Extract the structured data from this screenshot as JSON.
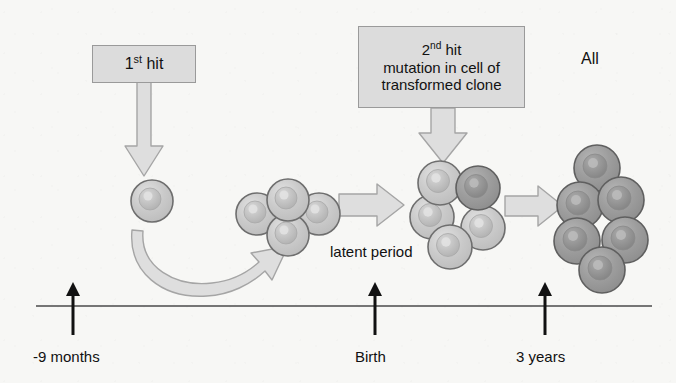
{
  "figure": {
    "background_color": "#f7f7f5",
    "boxes": [
      {
        "id": "first-hit",
        "lines": [
          "1st hit"
        ],
        "sup": "st",
        "x": 92,
        "y": 45,
        "w": 104,
        "h": 38,
        "font_size": 16,
        "fill": "#dcdcdc",
        "stroke": "#9a9a9a"
      },
      {
        "id": "second-hit",
        "lines": [
          "2nd hit",
          "mutation in cell of",
          "transformed clone"
        ],
        "sup": "nd",
        "x": 358,
        "y": 26,
        "w": 167,
        "h": 82,
        "font_size": 15,
        "fill": "#dcdcdc",
        "stroke": "#9a9a9a"
      }
    ],
    "labels": [
      {
        "id": "all-label",
        "text": "All",
        "x": 581,
        "y": 50,
        "font_size": 16
      },
      {
        "id": "latent-period-label",
        "text": "latent period",
        "x": 330,
        "y": 243,
        "font_size": 15
      }
    ],
    "timeline": {
      "y": 306,
      "x_start": 36,
      "x_end": 652,
      "color": "#4a4a4a",
      "ticks": [
        {
          "id": "tick-minus-9-months",
          "label": "-9 months",
          "x": 73,
          "label_x": 33,
          "label_y": 348
        },
        {
          "id": "tick-birth",
          "label": "Birth",
          "x": 375,
          "label_x": 355,
          "label_y": 348
        },
        {
          "id": "tick-3-years",
          "label": "3 years",
          "x": 545,
          "label_x": 516,
          "label_y": 348
        }
      ]
    },
    "cells": {
      "light_fill": "#c9c9c9",
      "light_nucleus": "#b4b4b4",
      "dark_fill": "#9a9a9a",
      "dark_nucleus": "#868686",
      "stroke": "#6e6e6e",
      "groups": [
        {
          "id": "single-founder-cell",
          "tone": "light",
          "members": [
            {
              "cx": 152,
              "cy": 201,
              "r": 21
            }
          ]
        },
        {
          "id": "transformed-clone-cluster",
          "tone": "light",
          "members": [
            {
              "cx": 288,
              "cy": 200,
              "r": 21
            },
            {
              "cx": 257,
              "cy": 214,
              "r": 21
            },
            {
              "cx": 319,
              "cy": 214,
              "r": 21
            },
            {
              "cx": 288,
              "cy": 235,
              "r": 21
            }
          ]
        },
        {
          "id": "second-hit-cluster",
          "tone": "mixed",
          "members": [
            {
              "cx": 440,
              "cy": 183,
              "r": 22
            },
            {
              "cx": 478,
              "cy": 188,
              "r": 22,
              "dark": true
            },
            {
              "cx": 432,
              "cy": 217,
              "r": 22
            },
            {
              "cx": 483,
              "cy": 228,
              "r": 22
            },
            {
              "cx": 450,
              "cy": 247,
              "r": 22
            }
          ]
        },
        {
          "id": "leukaemic-clone-cluster",
          "tone": "dark",
          "members": [
            {
              "cx": 597,
              "cy": 168,
              "r": 23,
              "dark": true
            },
            {
              "cx": 580,
              "cy": 205,
              "r": 23,
              "dark": true
            },
            {
              "cx": 621,
              "cy": 200,
              "r": 23,
              "dark": true
            },
            {
              "cx": 577,
              "cy": 241,
              "r": 23,
              "dark": true
            },
            {
              "cx": 625,
              "cy": 240,
              "r": 23,
              "dark": true
            },
            {
              "cx": 602,
              "cy": 270,
              "r": 23,
              "dark": true
            }
          ]
        }
      ]
    },
    "arrows": {
      "fill": "#dedede",
      "stroke": "#a5a5a5",
      "items": [
        {
          "id": "first-hit-down-arrow",
          "kind": "down"
        },
        {
          "id": "second-hit-down-arrow",
          "kind": "down"
        },
        {
          "id": "clone-expansion-curved-arrow",
          "kind": "curved"
        },
        {
          "id": "latent-period-right-arrow",
          "kind": "right"
        },
        {
          "id": "proliferation-right-arrow",
          "kind": "right"
        }
      ]
    }
  }
}
